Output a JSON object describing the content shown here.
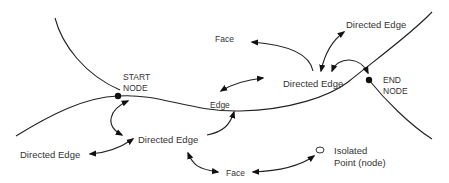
{
  "diagram": {
    "type": "topology-primitives",
    "labels": {
      "start_node": [
        "START",
        "NODE"
      ],
      "end_node": [
        "END",
        "NODE"
      ],
      "edge": "Edge",
      "face_top": "Face",
      "face_bottom": "Face",
      "directed_edge_center": "Directed Edge",
      "directed_edge_top_right": "Directed Edge",
      "directed_edge_lower_center": "Directed Edge",
      "directed_edge_left": "Directed Edge",
      "isolated_point": [
        "Isolated",
        "Point (node)"
      ]
    },
    "colors": {
      "line": "#222222",
      "text": "#333333",
      "node": "#111111",
      "background": "#ffffff"
    }
  }
}
